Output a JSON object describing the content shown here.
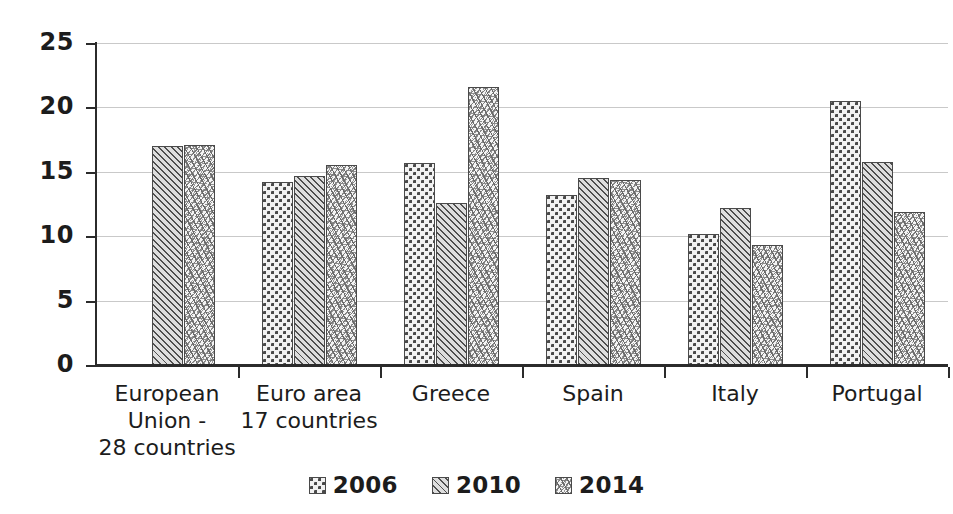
{
  "chart_data": {
    "type": "bar",
    "title": "",
    "xlabel": "",
    "ylabel": "",
    "ylim": [
      0,
      25
    ],
    "ytick_step": 5,
    "yticks": [
      "0",
      "5",
      "10",
      "15",
      "20",
      "25"
    ],
    "grid": true,
    "legend_position": "bottom",
    "categories": [
      "European\nUnion -\n28 countries",
      "Euro area\n17 countries",
      "Greece",
      "Spain",
      "Italy",
      "Portugal"
    ],
    "series": [
      {
        "name": "2006",
        "pattern": "checkerboard",
        "values": [
          null,
          14.2,
          15.7,
          13.2,
          10.2,
          20.5
        ]
      },
      {
        "name": "2010",
        "pattern": "diagonal-hatch",
        "values": [
          17.0,
          14.7,
          12.6,
          14.5,
          12.2,
          15.8
        ]
      },
      {
        "name": "2014",
        "pattern": "speckle",
        "values": [
          17.1,
          15.5,
          21.6,
          14.4,
          9.3,
          11.9
        ]
      }
    ]
  },
  "legend": {
    "items": [
      {
        "label": "2006"
      },
      {
        "label": "2010"
      },
      {
        "label": "2014"
      }
    ]
  },
  "colors": {
    "axis": "#2b2b2b",
    "gridline": "#c9c9c9",
    "text": "#1c1c1c",
    "bar_outline": "#4a4a4a",
    "background": "#ffffff"
  }
}
